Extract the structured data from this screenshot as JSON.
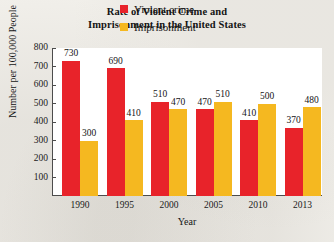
{
  "chart_data": {
    "type": "bar",
    "title": "Rate of Violent Crime and Imprisonment in the United States",
    "title_line1": "Rate of Violent Crime and",
    "title_line2": "Imprisonment in the United States",
    "xlabel": "Year",
    "ylabel": "Number per 100,000 People",
    "categories": [
      "1990",
      "1995",
      "2000",
      "2005",
      "2010",
      "2013"
    ],
    "ylim": [
      0,
      800
    ],
    "yticks": [
      "100",
      "200",
      "300",
      "400",
      "500",
      "600",
      "700",
      "800"
    ],
    "grid": false,
    "legend_position": "top-right-inside",
    "series": [
      {
        "name": "Violent crime",
        "color": "#e8232a",
        "values": [
          730,
          690,
          510,
          470,
          410,
          370
        ],
        "labels": [
          "730",
          "690",
          "510",
          "470",
          "410",
          "370"
        ]
      },
      {
        "name": "Imprisonment",
        "color": "#f5b820",
        "values": [
          300,
          410,
          470,
          510,
          500,
          480
        ],
        "labels": [
          "300",
          "410",
          "470",
          "510",
          "500",
          "480"
        ]
      }
    ]
  },
  "colors": {
    "violent_crime": "#e8232a",
    "imprisonment": "#f5b820",
    "axis": "#4c4c4c",
    "page": "#f1efea",
    "plot": "#ffffff"
  }
}
